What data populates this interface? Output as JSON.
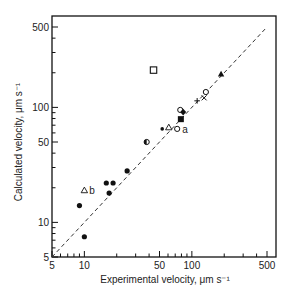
{
  "chart_data": {
    "type": "scatter",
    "title": "",
    "xlabel": "Experimental velocity, μm s⁻¹",
    "ylabel": "Calculated velocity, μm s⁻¹",
    "xscale": "log",
    "yscale": "log",
    "xlim": [
      5,
      500
    ],
    "ylim": [
      5,
      500
    ],
    "x_ticks": [
      5,
      10,
      50,
      100,
      500
    ],
    "y_ticks": [
      5,
      10,
      50,
      100,
      500
    ],
    "grid": false,
    "reference_line": {
      "type": "y=x",
      "style": "dashed",
      "from": [
        5,
        5
      ],
      "to": [
        480,
        480
      ]
    },
    "points": [
      {
        "x": 10,
        "y": 19,
        "marker": "open-triangle",
        "label": "b"
      },
      {
        "x": 9,
        "y": 14,
        "marker": "filled-circle"
      },
      {
        "x": 10,
        "y": 7.5,
        "marker": "filled-circle"
      },
      {
        "x": 16,
        "y": 22,
        "marker": "filled-circle"
      },
      {
        "x": 18.5,
        "y": 22,
        "marker": "filled-circle"
      },
      {
        "x": 17,
        "y": 18,
        "marker": "filled-circle"
      },
      {
        "x": 25,
        "y": 28,
        "marker": "filled-circle"
      },
      {
        "x": 38,
        "y": 50,
        "marker": "half-filled-circle"
      },
      {
        "x": 53,
        "y": 65,
        "marker": "small-filled-circle"
      },
      {
        "x": 61,
        "y": 67,
        "marker": "open-triangle"
      },
      {
        "x": 73,
        "y": 65,
        "marker": "open-circle",
        "label": "a"
      },
      {
        "x": 79,
        "y": 79,
        "marker": "filled-square"
      },
      {
        "x": 78,
        "y": 95,
        "marker": "open-circle"
      },
      {
        "x": 83,
        "y": 91,
        "marker": "filled-diamond"
      },
      {
        "x": 112,
        "y": 114,
        "marker": "plus"
      },
      {
        "x": 130,
        "y": 121,
        "marker": "cross"
      },
      {
        "x": 135,
        "y": 136,
        "marker": "open-circle"
      },
      {
        "x": 187,
        "y": 195,
        "marker": "filled-triangle"
      },
      {
        "x": 44,
        "y": 211,
        "marker": "open-square"
      }
    ]
  },
  "labels": {
    "xlabel": "Experimental velocity,  μm s⁻¹",
    "ylabel": "Calculated velocity,  μm s⁻¹",
    "x_ticks": [
      "5",
      "10",
      "50",
      "100",
      "500"
    ],
    "y_ticks": [
      "5",
      "10",
      "50",
      "100",
      "500"
    ],
    "point_a": "a",
    "point_b": "b"
  }
}
